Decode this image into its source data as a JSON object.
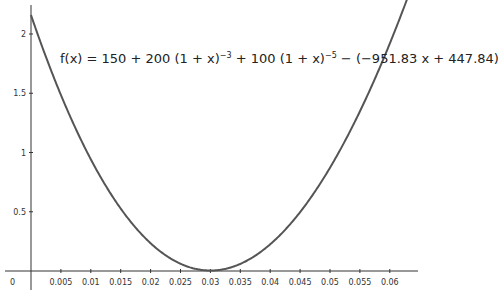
{
  "chart_data": {
    "type": "line",
    "title": "",
    "annotation": "f(x) = 150 + 200 (1 + x)^-3 + 100 (1 + x)^-5 − (−951.83 x + 447.84)",
    "function": {
      "c0": 150,
      "c1": 200,
      "p1": -3,
      "c2": 100,
      "p2": -5,
      "slope": -951.83,
      "intercept": 447.84
    },
    "xlabel": "",
    "ylabel": "",
    "x_ticks": [
      "0",
      "0.005",
      "0.01",
      "0.015",
      "0.02",
      "0.025",
      "0.03",
      "0.035",
      "0.04",
      "0.045",
      "0.05",
      "0.055",
      "0.06"
    ],
    "y_ticks": [
      "0.5",
      "1",
      "1.5",
      "2"
    ],
    "xlim": [
      0,
      0.0633
    ],
    "ylim": [
      0,
      2.2
    ],
    "grid": false,
    "series": [
      {
        "name": "f",
        "x": [
          0,
          0.01,
          0.02,
          0.03,
          0.04,
          0.05,
          0.06
        ],
        "values": [
          2.16,
          0.9,
          0.23,
          0.01,
          0.2,
          0.78,
          1.74
        ]
      }
    ]
  },
  "formula": {
    "lhs": "f(x)",
    "eq": " = 150 + 200 (1 + x)",
    "exp1": "−3",
    "mid": " + 100 (1 + x)",
    "exp2": "−5",
    "tail": " − (−951.83 x + 447.84)"
  }
}
